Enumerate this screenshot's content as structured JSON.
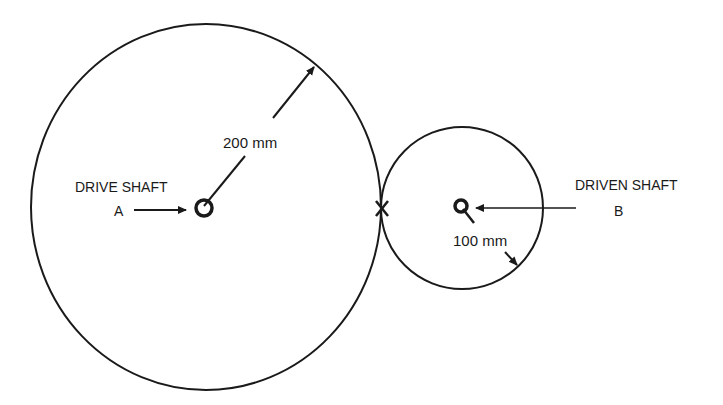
{
  "diagram": {
    "drive_shaft": {
      "title": "DRIVE SHAFT",
      "letter": "A",
      "radius_label": "200 mm"
    },
    "driven_shaft": {
      "title": "DRIVEN SHAFT",
      "letter": "B",
      "radius_label": "100 mm"
    },
    "contact_mark": "×",
    "colors": {
      "ink": "#1a1a1a",
      "background": "#ffffff"
    }
  }
}
